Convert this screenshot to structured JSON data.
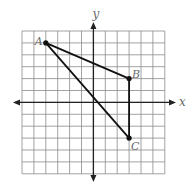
{
  "figure": {
    "type": "coordinate-plane",
    "axes": {
      "x_label": "x",
      "y_label": "y"
    },
    "grid": {
      "x_min": -6,
      "x_max": 6,
      "y_min": -6,
      "y_max": 6,
      "step": 1
    },
    "triangle": {
      "points": [
        {
          "label": "A",
          "x": -4,
          "y": 5
        },
        {
          "label": "B",
          "x": 3,
          "y": 2
        },
        {
          "label": "C",
          "x": 3,
          "y": -3
        }
      ]
    },
    "colors": {
      "grid": "#8a8a8a",
      "axis": "#222222",
      "triangle": "#111111",
      "label": "#6a6a6a"
    }
  }
}
